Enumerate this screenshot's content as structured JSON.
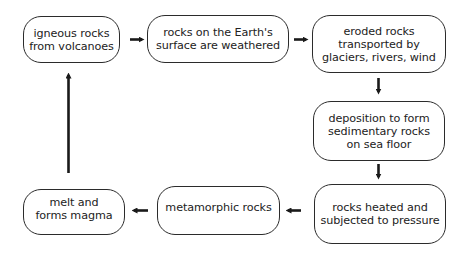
{
  "diagram": {
    "type": "rock-cycle-flowchart",
    "nodes": [
      {
        "id": "n1",
        "label": "igneous rocks\nfrom volcanoes"
      },
      {
        "id": "n2",
        "label": "rocks on the Earth's\nsurface are weathered"
      },
      {
        "id": "n3",
        "label": "eroded rocks\ntransported by\nglaciers, rivers, wind"
      },
      {
        "id": "n4",
        "label": "deposition to form\nsedimentary rocks\non sea floor"
      },
      {
        "id": "n5",
        "label": "rocks heated and\nsubjected to pressure"
      },
      {
        "id": "n6",
        "label": "metamorphic rocks"
      },
      {
        "id": "n7",
        "label": "melt and\nforms magma"
      }
    ],
    "edges": [
      {
        "from": "n1",
        "to": "n2",
        "direction": "right"
      },
      {
        "from": "n2",
        "to": "n3",
        "direction": "right"
      },
      {
        "from": "n3",
        "to": "n4",
        "direction": "down"
      },
      {
        "from": "n4",
        "to": "n5",
        "direction": "down"
      },
      {
        "from": "n5",
        "to": "n6",
        "direction": "left"
      },
      {
        "from": "n6",
        "to": "n7",
        "direction": "left"
      },
      {
        "from": "n7",
        "to": "n1",
        "direction": "up"
      }
    ],
    "colors": {
      "stroke": "#2b2b2b",
      "background": "#ffffff",
      "text": "#222222"
    }
  }
}
